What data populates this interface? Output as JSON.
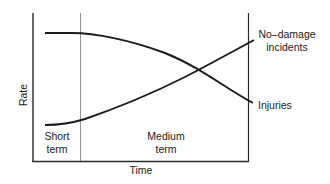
{
  "diagram": {
    "y_axis_label": "Rate",
    "x_axis_label": "Time",
    "phases": [
      {
        "line1": "Short",
        "line2": "term"
      },
      {
        "line1": "Medium",
        "line2": "term"
      }
    ],
    "series": [
      {
        "name": "No-damage incidents",
        "label_line1": "No–damage",
        "label_line2": "incidents",
        "trend": "rising"
      },
      {
        "name": "Injuries",
        "label_line1": "Injuries",
        "trend": "falling"
      }
    ],
    "colors": {
      "curve": "#1a1a1a",
      "axis": "#2a2a2a",
      "divider": "#777777"
    }
  }
}
